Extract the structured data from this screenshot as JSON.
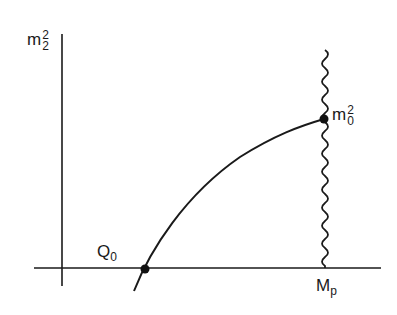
{
  "diagram": {
    "axes": {
      "y_label": {
        "base": "m",
        "sup": "2",
        "sub": "2"
      },
      "x_axis_label": {
        "base": "M",
        "sub": "p"
      }
    },
    "points": {
      "q0": {
        "base": "Q",
        "sub": "0"
      },
      "m0": {
        "base": "m",
        "sup": "2",
        "sub": "0"
      }
    },
    "colors": {
      "line": "#1a1a1a",
      "background": "#ffffff"
    }
  }
}
